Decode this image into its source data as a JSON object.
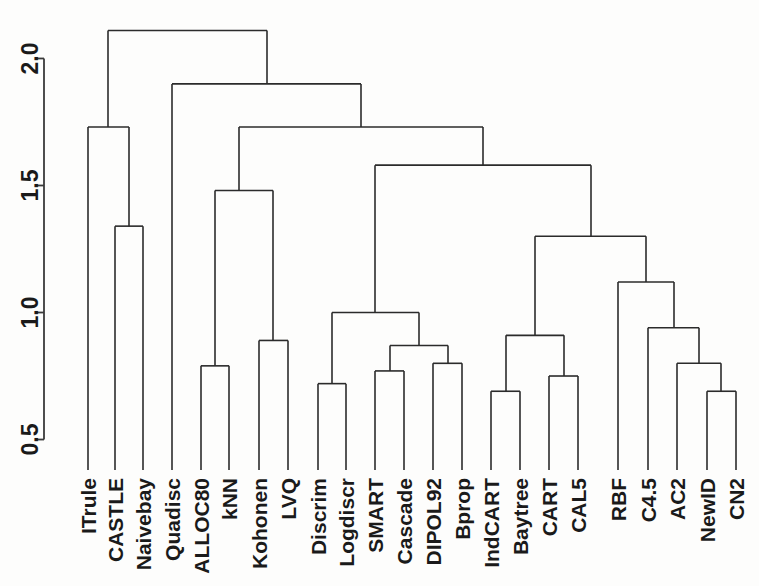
{
  "figure": {
    "title": "",
    "orientation": "rotated-90",
    "background_color": "#fdfdfc",
    "line_color": "#2b2b2b"
  },
  "axis": {
    "name": "height-axis",
    "label": "",
    "ticks": [
      "2.0",
      "1.5",
      "1.0",
      "0.5"
    ],
    "tick_values": [
      2.0,
      1.5,
      1.0,
      0.5
    ],
    "range": [
      0.38,
      2.12
    ]
  },
  "chart_data": {
    "type": "dendrogram",
    "title": "",
    "xlabel": "",
    "ylabel": "",
    "grid": false,
    "legend": "none",
    "axis_ticks": [
      "0.5",
      "1.0",
      "1.5",
      "2.0"
    ],
    "axis_tick_values": [
      0.5,
      1.0,
      1.5,
      2.0
    ],
    "ylim": [
      0.38,
      2.12
    ],
    "leaves": [
      "ITrule",
      "CASTLE",
      "Naivebay",
      "Quadisc",
      "ALLOC80",
      "kNN",
      "Kohonen",
      "LVQ",
      "Discrim",
      "Logdiscr",
      "SMART",
      "Cascade",
      "DIPOL92",
      "Bprop",
      "IndCART",
      "Baytree",
      "CART",
      "CAL5",
      "RBF",
      "C4.5",
      "AC2",
      "NewID",
      "CN2"
    ],
    "leaf_x": [
      88,
      115,
      143,
      172,
      201,
      229,
      259,
      288,
      318,
      346,
      375,
      404,
      433,
      462,
      491,
      520,
      549,
      578,
      618,
      648,
      677,
      707,
      736
    ],
    "merges": [
      {
        "id": "m1",
        "left": "CASTLE",
        "right": "Naivebay",
        "height": 1.34,
        "x": 129
      },
      {
        "id": "m2",
        "left": "ITrule",
        "right": "m1",
        "height": 1.73,
        "x": 108
      },
      {
        "id": "m3",
        "left": "ALLOC80",
        "right": "kNN",
        "height": 0.79,
        "x": 215
      },
      {
        "id": "m4",
        "left": "Kohonen",
        "right": "LVQ",
        "height": 0.89,
        "x": 273
      },
      {
        "id": "m5",
        "left": "m3",
        "right": "m4",
        "height": 1.48,
        "x": 239
      },
      {
        "id": "m6",
        "left": "Discrim",
        "right": "Logdiscr",
        "height": 0.72,
        "x": 332
      },
      {
        "id": "m7",
        "left": "SMART",
        "right": "Cascade",
        "height": 0.77,
        "x": 390
      },
      {
        "id": "m8",
        "left": "DIPOL92",
        "right": "Bprop",
        "height": 0.8,
        "x": 448
      },
      {
        "id": "m9",
        "left": "m7",
        "right": "m8",
        "height": 0.87,
        "x": 419
      },
      {
        "id": "m10",
        "left": "m6",
        "right": "m9",
        "height": 1.0,
        "x": 375
      },
      {
        "id": "m11",
        "left": "IndCART",
        "right": "Baytree",
        "height": 0.69,
        "x": 506
      },
      {
        "id": "m12",
        "left": "CART",
        "right": "CAL5",
        "height": 0.75,
        "x": 564
      },
      {
        "id": "m13",
        "left": "m11",
        "right": "m12",
        "height": 0.91,
        "x": 535
      },
      {
        "id": "m14",
        "left": "NewID",
        "right": "CN2",
        "height": 0.69,
        "x": 721
      },
      {
        "id": "m15",
        "left": "AC2",
        "right": "m14",
        "height": 0.8,
        "x": 699
      },
      {
        "id": "m16",
        "left": "C4.5",
        "right": "m15",
        "height": 0.94,
        "x": 674
      },
      {
        "id": "m17",
        "left": "RBF",
        "right": "m16",
        "height": 1.12,
        "x": 646
      },
      {
        "id": "m18",
        "left": "m13",
        "right": "m17",
        "height": 1.3,
        "x": 591
      },
      {
        "id": "m19",
        "left": "m10",
        "right": "m18",
        "height": 1.58,
        "x": 483
      },
      {
        "id": "m20",
        "left": "m5",
        "right": "m19",
        "height": 1.73,
        "x": 361
      },
      {
        "id": "m21",
        "left": "Quadisc",
        "right": "m20",
        "height": 1.9,
        "x": 267
      },
      {
        "id": "m22",
        "left": "m2",
        "right": "m21",
        "height": 2.11,
        "x": 188
      }
    ]
  }
}
